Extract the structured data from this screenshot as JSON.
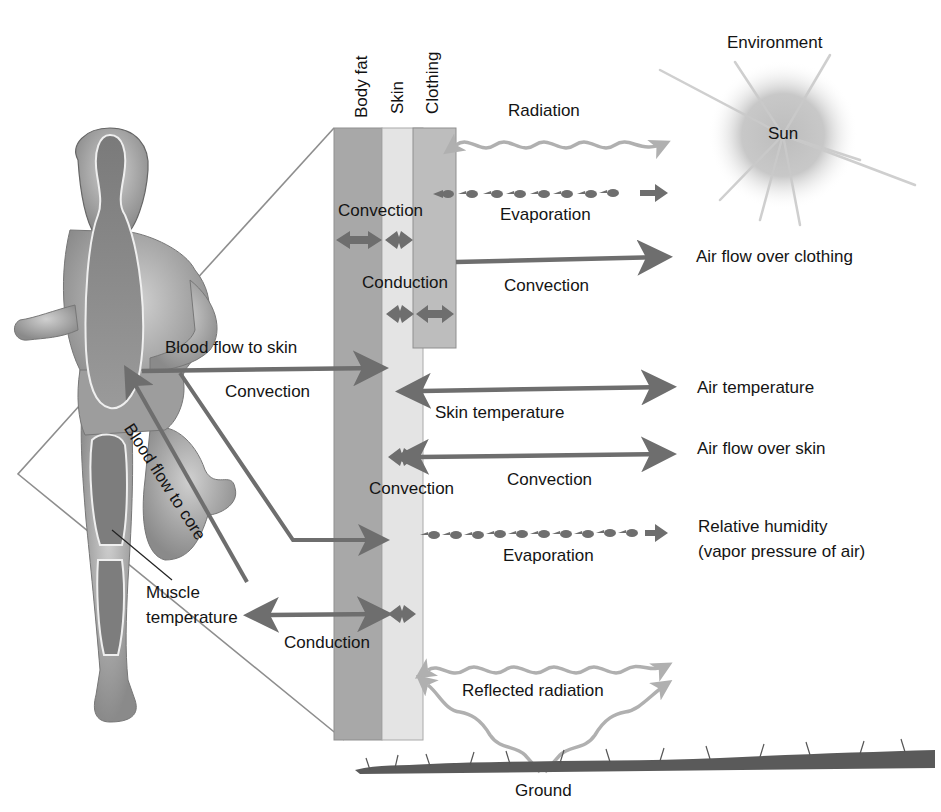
{
  "diagram": {
    "layers": {
      "body_fat": "Body fat",
      "skin": "Skin",
      "clothing": "Clothing"
    },
    "environment": {
      "heading": "Environment",
      "sun": "Sun",
      "ground": "Ground"
    },
    "body_labels": {
      "blood_flow_to_skin": "Blood flow to skin",
      "blood_flow_to_core": "Blood flow to core",
      "muscle_temperature_line1": "Muscle",
      "muscle_temperature_line2": "temperature"
    },
    "process_labels": {
      "radiation": "Radiation",
      "evaporation_clothing": "Evaporation",
      "convection_inner": "Convection",
      "conduction_inner": "Conduction",
      "convection_clothing": "Convection",
      "convection_blood": "Convection",
      "skin_temperature": "Skin temperature",
      "convection_skin_inner": "Convection",
      "convection_skin": "Convection",
      "evaporation_skin": "Evaporation",
      "conduction_muscle": "Conduction",
      "reflected_radiation": "Reflected radiation"
    },
    "environment_factors": {
      "air_flow_clothing": "Air flow over clothing",
      "air_temperature": "Air temperature",
      "air_flow_skin": "Air flow over skin",
      "relative_humidity_line1": "Relative humidity",
      "relative_humidity_line2": "(vapor pressure of air)"
    },
    "colors": {
      "body_fat": "#a8a8a8",
      "skin": "#e4e4e4",
      "clothing": "#bdbdbd",
      "arrow_dark": "#6e6e6e",
      "arrow_light": "#b0b0b0",
      "sun": "#c4c4c4",
      "grass": "#555555"
    }
  }
}
